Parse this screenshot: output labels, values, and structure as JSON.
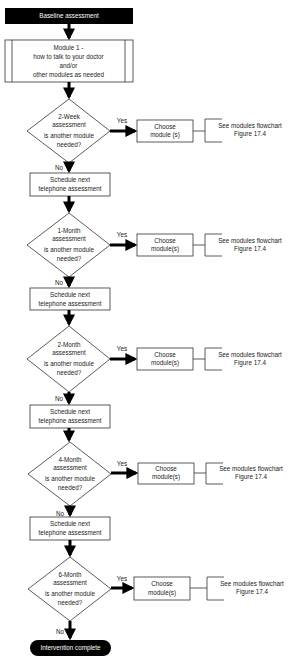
{
  "flowchart": {
    "start": {
      "label": "Baseline assessment",
      "fill": "#000000",
      "text_color": "#ffffff"
    },
    "module1": {
      "lines": [
        "Module 1 -",
        "how to talk to your doctor",
        "and/or",
        "other modules as needed"
      ]
    },
    "stages": [
      {
        "title": "2-Week",
        "line2": "assessment",
        "question_l1": "is another module",
        "question_l2": "needed?",
        "yes_label": "Yes",
        "no_label": "No",
        "choose_l1": "Choose",
        "choose_l2": "module (s)",
        "ref_l1": "See modules flowchart",
        "ref_l2": "Figure 17.4",
        "schedule_l1": "Schedule next",
        "schedule_l2": "telephone assessment"
      },
      {
        "title": "1-Month",
        "line2": "assessment",
        "question_l1": "is another module",
        "question_l2": "needed?",
        "yes_label": "Yes",
        "no_label": "No",
        "choose_l1": "Choose",
        "choose_l2": "module(s)",
        "ref_l1": "See modules flowchart",
        "ref_l2": "Figure 17.4",
        "schedule_l1": "Schedule next",
        "schedule_l2": "telephone assessment"
      },
      {
        "title": "2-Month",
        "line2": "assessment",
        "question_l1": "is another module",
        "question_l2": "needed?",
        "yes_label": "Yes",
        "no_label": "No",
        "choose_l1": "Choose",
        "choose_l2": "module(s)",
        "ref_l1": "See modules flowchart",
        "ref_l2": "Figure 17.4",
        "schedule_l1": "Schedule next",
        "schedule_l2": "telephone assessment"
      },
      {
        "title": "4-Month",
        "line2": "assessment",
        "question_l1": "is another module",
        "question_l2": "needed?",
        "yes_label": "Yes",
        "no_label": "No",
        "choose_l1": "Choose",
        "choose_l2": "module(s)",
        "ref_l1": "See modules flowchart",
        "ref_l2": "Figure 17.4",
        "schedule_l1": "Schedule next",
        "schedule_l2": "telephone assessment"
      },
      {
        "title": "6-Month",
        "line2": "assessment",
        "question_l1": "is another module",
        "question_l2": "needed?",
        "yes_label": "Yes",
        "no_label": "No",
        "choose_l1": "Choose",
        "choose_l2": "module(s)",
        "ref_l1": "See modules flowchart",
        "ref_l2": "Figure 17.4"
      }
    ],
    "end": {
      "label": "Intervention complete",
      "fill": "#000000",
      "text_color": "#ffffff"
    },
    "colors": {
      "stroke": "#333333",
      "arrow": "#000000",
      "background": "#ffffff"
    }
  }
}
